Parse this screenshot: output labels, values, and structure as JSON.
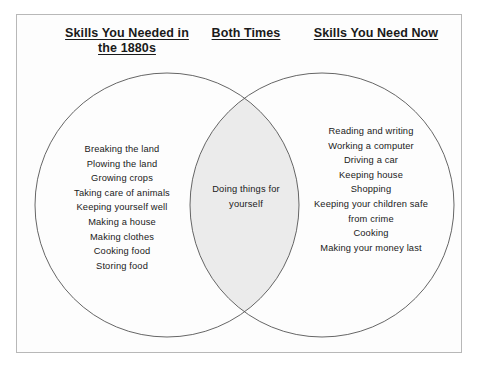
{
  "diagram": {
    "type": "venn",
    "headings": {
      "left": "Skills You Needed in the 1880s",
      "left_line1": "Skills You Needed in",
      "left_line2": "the 1880s",
      "center": "Both Times",
      "right": "Skills You Need Now"
    },
    "left_circle": {
      "label": "Skills You Needed in the 1880s",
      "items": [
        "Breaking the land",
        "Plowing the land",
        "Growing crops",
        "Taking care of animals",
        "Keeping yourself well",
        "Making a house",
        "Making clothes",
        "Cooking food",
        "Storing food"
      ]
    },
    "right_circle": {
      "label": "Skills You Need Now",
      "items": [
        "Reading and writing",
        "Working a computer",
        "Driving a car",
        "Keeping house",
        "Shopping",
        "Keeping your children safe",
        "from crime",
        "Cooking",
        "Making your money last"
      ]
    },
    "overlap": {
      "label": "Both Times",
      "items": [
        "Doing things for",
        "yourself"
      ]
    },
    "colors": {
      "frame_border": "#b8b8b8",
      "circle_stroke": "#555555",
      "overlap_fill": "#ebebeb",
      "text": "#1a1a1a",
      "background": "#ffffff"
    }
  }
}
